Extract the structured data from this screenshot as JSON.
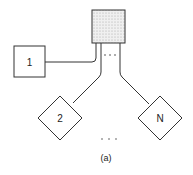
{
  "diagram": {
    "hub": {
      "label": "",
      "fill_pattern": "stippled",
      "color": "#e8e8e8"
    },
    "nodes": [
      {
        "id": "1",
        "label": "1",
        "shape": "square"
      },
      {
        "id": "2",
        "label": "2",
        "shape": "diamond"
      },
      {
        "id": "N",
        "label": "N",
        "shape": "diamond"
      }
    ],
    "connector_ellipsis": "· · ·",
    "bottom_ellipsis": "· · ·",
    "caption": "(a)",
    "stroke_color": "#333333"
  }
}
